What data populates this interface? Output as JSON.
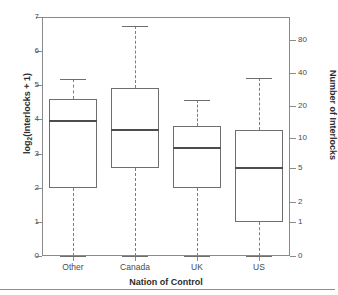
{
  "figure": {
    "left_axis_label": "log",
    "left_axis_label_sub": "2",
    "left_axis_label_rest": "(Interlocks + 1)",
    "right_axis_label": "Number of Interlocks",
    "x_axis_label": "Nation of Control"
  },
  "chart_data": {
    "type": "box",
    "title": "",
    "xlabel": "Nation of Control",
    "ylabel": "log2(Interlocks + 1)",
    "y2label": "Number of Interlocks",
    "categories": [
      "Other",
      "Canada",
      "UK",
      "US"
    ],
    "ylim": [
      0,
      7
    ],
    "grid": false,
    "legend": "none",
    "left_ticks": [
      0,
      1,
      2,
      3,
      4,
      5,
      6,
      7
    ],
    "left_tick_labels": [
      "0",
      "1",
      "2",
      "3",
      "4",
      "5",
      "6",
      "7"
    ],
    "right_tick_labels": [
      "0",
      "1",
      "2",
      "5",
      "10",
      "20",
      "40",
      "80"
    ],
    "right_tick_positions": [
      0,
      1,
      1.58,
      2.58,
      3.46,
      4.39,
      5.36,
      6.34
    ],
    "boxes": [
      {
        "category": "Other",
        "whisker_low": 0.0,
        "q1": 2.0,
        "median": 3.95,
        "q3": 4.6,
        "whisker_high": 5.17,
        "outliers": []
      },
      {
        "category": "Canada",
        "whisker_low": 0.0,
        "q1": 2.58,
        "median": 3.7,
        "q3": 4.91,
        "whisker_high": 6.75,
        "outliers": []
      },
      {
        "category": "UK",
        "whisker_low": 0.0,
        "q1": 2.0,
        "median": 3.17,
        "q3": 3.82,
        "whisker_high": 4.58,
        "outliers": []
      },
      {
        "category": "US",
        "whisker_low": 0.0,
        "q1": 1.0,
        "median": 2.58,
        "q3": 3.7,
        "whisker_high": 5.2,
        "outliers": []
      }
    ],
    "colors": {
      "box_stroke": "#6e6e6e",
      "median_stroke": "#4d4d4d",
      "whisker_stroke": "#7d7d7d",
      "axis_stroke": "#8a8a8a",
      "text": "#3a3a3a",
      "background": "#ffffff"
    }
  }
}
